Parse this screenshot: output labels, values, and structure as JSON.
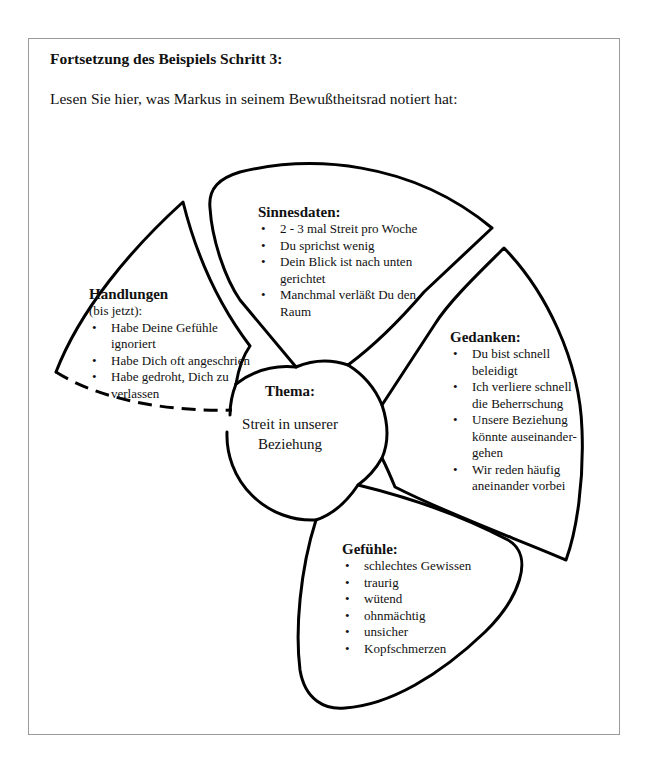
{
  "heading": "Fortsetzung des Beispiels Schritt 3:",
  "intro": "Lesen Sie hier, was Markus in seinem Bewußtheitsrad notiert hat:",
  "wheel": {
    "center": {
      "title": "Thema:",
      "body_line1": "Streit in unserer",
      "body_line2": "Beziehung"
    },
    "sinnesdaten": {
      "title": "Sinnesdaten:",
      "items": [
        "2 - 3 mal Streit pro Woche",
        "Du sprichst wenig",
        "Dein Blick ist nach unten gerichtet",
        "Manchmal verläßt Du den Raum"
      ]
    },
    "gedanken": {
      "title": "Gedanken:",
      "items": [
        "Du bist schnell beleidigt",
        "Ich verliere schnell die Beherrschung",
        "Unsere Beziehung könnte auseinander-gehen",
        "Wir reden häufig aneinander vorbei"
      ]
    },
    "gefuehle": {
      "title": "Gefühle:",
      "items": [
        "schlechtes Gewissen",
        "traurig",
        "wütend",
        "ohnmächtig",
        "unsicher",
        "Kopfschmerzen"
      ]
    },
    "handlungen": {
      "title": "Handlungen",
      "subtitle": "(bis jetzt):",
      "items": [
        "Habe Deine Gefühle ignoriert",
        "Habe Dich oft angeschrien",
        "Habe gedroht, Dich zu verlassen"
      ]
    }
  },
  "colors": {
    "stroke": "#000000",
    "frame": "#9a9a9a",
    "text": "#111111",
    "background": "#ffffff"
  }
}
